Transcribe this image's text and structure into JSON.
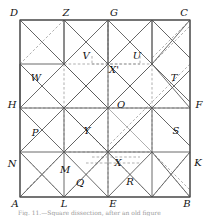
{
  "figure": {
    "type": "geometric-dissection-diagram",
    "caption": "Fig. 11.—Square dissection, after an old figure",
    "colors": {
      "solid_line": "#5a5a5a",
      "dashed_line": "#8c8c8c",
      "border": "#4a4a4a",
      "label": "#111111",
      "background": "#ffffff"
    },
    "square": {
      "left": 20,
      "top": 20,
      "right": 190,
      "bottom": 197,
      "grid_divisions": 4
    },
    "labels": [
      {
        "id": "D",
        "text": "D",
        "x": 14,
        "y": 13
      },
      {
        "id": "Z",
        "text": "Z",
        "x": 66,
        "y": 13
      },
      {
        "id": "G",
        "text": "G",
        "x": 114,
        "y": 13
      },
      {
        "id": "C",
        "text": "C",
        "x": 184,
        "y": 13
      },
      {
        "id": "V",
        "text": "V",
        "x": 86,
        "y": 56
      },
      {
        "id": "U",
        "text": "U",
        "x": 137,
        "y": 56
      },
      {
        "id": "Xp",
        "text": "X'",
        "x": 114,
        "y": 70
      },
      {
        "id": "W",
        "text": "W",
        "x": 36,
        "y": 78
      },
      {
        "id": "T",
        "text": "T",
        "x": 174,
        "y": 78
      },
      {
        "id": "H",
        "text": "H",
        "x": 12,
        "y": 105
      },
      {
        "id": "O",
        "text": "O",
        "x": 121,
        "y": 105
      },
      {
        "id": "F",
        "text": "F",
        "x": 199,
        "y": 105
      },
      {
        "id": "P",
        "text": "P",
        "x": 35,
        "y": 133
      },
      {
        "id": "Y",
        "text": "Y",
        "x": 87,
        "y": 131
      },
      {
        "id": "S",
        "text": "S",
        "x": 176,
        "y": 131
      },
      {
        "id": "N",
        "text": "N",
        "x": 12,
        "y": 164
      },
      {
        "id": "M",
        "text": "M",
        "x": 65,
        "y": 170
      },
      {
        "id": "X",
        "text": "X",
        "x": 118,
        "y": 163
      },
      {
        "id": "K",
        "text": "K",
        "x": 198,
        "y": 163
      },
      {
        "id": "Q",
        "text": "Q",
        "x": 80,
        "y": 183
      },
      {
        "id": "R",
        "text": "R",
        "x": 130,
        "y": 182
      },
      {
        "id": "A",
        "text": "A",
        "x": 15,
        "y": 204
      },
      {
        "id": "L",
        "text": "L",
        "x": 64,
        "y": 204
      },
      {
        "id": "E",
        "text": "E",
        "x": 113,
        "y": 204
      },
      {
        "id": "B",
        "text": "B",
        "x": 187,
        "y": 204
      }
    ],
    "solid_segments": [
      [
        20,
        20,
        190,
        20
      ],
      [
        190,
        20,
        190,
        197
      ],
      [
        190,
        197,
        20,
        197
      ],
      [
        20,
        197,
        20,
        20
      ],
      [
        20,
        64,
        64,
        64
      ],
      [
        64,
        64,
        64,
        20
      ],
      [
        64,
        20,
        108,
        64
      ],
      [
        108,
        64,
        108,
        20
      ],
      [
        108,
        20,
        152,
        64
      ],
      [
        152,
        64,
        152,
        20
      ],
      [
        152,
        20,
        190,
        58
      ],
      [
        20,
        64,
        64,
        108
      ],
      [
        64,
        108,
        108,
        64
      ],
      [
        108,
        64,
        152,
        108
      ],
      [
        152,
        108,
        190,
        70
      ],
      [
        64,
        64,
        108,
        108
      ],
      [
        108,
        108,
        152,
        64
      ],
      [
        152,
        64,
        190,
        102
      ],
      [
        64,
        108,
        108,
        152
      ],
      [
        108,
        152,
        152,
        108
      ],
      [
        20,
        108,
        64,
        152
      ],
      [
        64,
        152,
        108,
        108
      ],
      [
        152,
        108,
        190,
        146
      ],
      [
        20,
        152,
        64,
        108
      ],
      [
        20,
        108,
        64,
        108
      ],
      [
        64,
        108,
        108,
        108
      ],
      [
        108,
        108,
        152,
        108
      ],
      [
        152,
        108,
        190,
        108
      ],
      [
        64,
        64,
        108,
        108
      ],
      [
        20,
        152,
        64,
        152
      ],
      [
        64,
        152,
        108,
        152
      ],
      [
        108,
        152,
        152,
        152
      ],
      [
        152,
        152,
        190,
        152
      ],
      [
        64,
        108,
        64,
        152
      ],
      [
        108,
        108,
        108,
        152
      ],
      [
        152,
        108,
        152,
        152
      ],
      [
        20,
        152,
        64,
        197
      ],
      [
        64,
        197,
        108,
        152
      ],
      [
        108,
        152,
        152,
        197
      ],
      [
        152,
        197,
        190,
        152
      ],
      [
        64,
        152,
        108,
        197
      ],
      [
        108,
        197,
        152,
        152
      ],
      [
        64,
        152,
        64,
        197
      ],
      [
        108,
        152,
        108,
        197
      ],
      [
        152,
        152,
        152,
        197
      ],
      [
        64,
        20,
        64,
        64
      ],
      [
        108,
        20,
        108,
        64
      ],
      [
        152,
        20,
        152,
        64
      ],
      [
        64,
        64,
        108,
        20
      ],
      [
        108,
        64,
        152,
        20
      ],
      [
        20,
        64,
        20,
        108
      ],
      [
        108,
        64,
        108,
        108
      ],
      [
        108,
        64,
        152,
        108
      ],
      [
        108,
        64,
        64,
        108
      ],
      [
        20,
        108,
        64,
        64
      ],
      [
        190,
        108,
        152,
        64
      ],
      [
        64,
        108,
        108,
        152
      ],
      [
        152,
        108,
        108,
        152
      ],
      [
        152,
        64,
        190,
        20
      ],
      [
        64,
        64,
        20,
        20
      ],
      [
        152,
        152,
        190,
        197
      ],
      [
        64,
        152,
        20,
        197
      ]
    ],
    "dashed_segments": [
      [
        20,
        20,
        64,
        64
      ],
      [
        64,
        20,
        20,
        64
      ],
      [
        152,
        20,
        190,
        58
      ],
      [
        190,
        20,
        152,
        58
      ],
      [
        20,
        152,
        64,
        197
      ],
      [
        64,
        152,
        20,
        197
      ],
      [
        152,
        152,
        190,
        197
      ],
      [
        190,
        152,
        152,
        197
      ],
      [
        20,
        108,
        190,
        108
      ],
      [
        108,
        20,
        108,
        197
      ],
      [
        64,
        64,
        64,
        152
      ],
      [
        152,
        64,
        152,
        152
      ],
      [
        64,
        64,
        152,
        64
      ],
      [
        64,
        152,
        152,
        152
      ],
      [
        92,
        64,
        140,
        64
      ],
      [
        92,
        157,
        140,
        157
      ],
      [
        86,
        163,
        140,
        163
      ],
      [
        64,
        20,
        152,
        108
      ],
      [
        152,
        20,
        64,
        108
      ],
      [
        64,
        108,
        152,
        197
      ],
      [
        152,
        108,
        64,
        197
      ],
      [
        20,
        64,
        108,
        152
      ],
      [
        108,
        64,
        20,
        152
      ],
      [
        108,
        64,
        190,
        146
      ],
      [
        190,
        64,
        108,
        146
      ],
      [
        64,
        64,
        190,
        190
      ],
      [
        152,
        64,
        26,
        190
      ],
      [
        64,
        152,
        190,
        26
      ],
      [
        152,
        152,
        26,
        26
      ],
      [
        92,
        56,
        92,
        64
      ],
      [
        140,
        56,
        140,
        64
      ]
    ]
  }
}
